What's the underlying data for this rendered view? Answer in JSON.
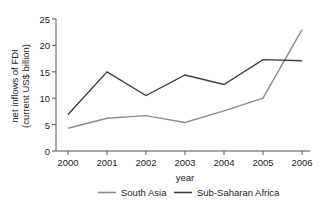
{
  "chart_data": {
    "type": "line",
    "title": "",
    "xlabel": "year",
    "ylabel": "net inflows of FDI (current US$ billion)",
    "ylabel_line1": "net inflows of FDI",
    "ylabel_line2": "(current US$ billion)",
    "categories": [
      "2000",
      "2001",
      "2002",
      "2003",
      "2004",
      "2005",
      "2006"
    ],
    "x": [
      2000,
      2001,
      2002,
      2003,
      2004,
      2005,
      2006
    ],
    "xlim": [
      2000,
      2006
    ],
    "ylim": [
      0,
      25
    ],
    "yticks": [
      "0",
      "5",
      "10",
      "15",
      "20",
      "25"
    ],
    "ytick_values": [
      0,
      5,
      10,
      15,
      20,
      25
    ],
    "xticks": [
      "2000",
      "2001",
      "2002",
      "2003",
      "2004",
      "2005",
      "2006"
    ],
    "grid": false,
    "legend_position": "bottom",
    "series": [
      {
        "name": "South Asia",
        "color": "#8c8c8c",
        "values": [
          4.3,
          6.2,
          6.7,
          5.4,
          7.6,
          10.0,
          23.0
        ]
      },
      {
        "name": "Sub-Saharan Africa",
        "color": "#3d3d3d",
        "values": [
          6.9,
          15.0,
          10.5,
          14.4,
          12.6,
          17.3,
          17.1
        ]
      }
    ]
  },
  "legend": {
    "items": [
      {
        "label": "South Asia",
        "color": "#8c8c8c"
      },
      {
        "label": "Sub-Saharan Africa",
        "color": "#3d3d3d"
      }
    ]
  },
  "axes": {
    "x_title": "year",
    "y_title_line1": "net inflows of FDI",
    "y_title_line2": "(current US$ billion)"
  }
}
